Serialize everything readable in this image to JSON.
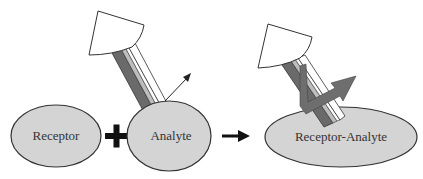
{
  "diagram": {
    "labels": {
      "receptor": "Receptor",
      "analyte": "Analyte",
      "complex": "Receptor-Analyte"
    },
    "operators": {
      "plus": "+",
      "yields": "→"
    },
    "colors": {
      "ellipse_fill": "#d4d4d4",
      "ellipse_stroke": "#333333",
      "stick_dark": "#6a6a6a",
      "stick_light": "#bdbdbd",
      "cup_fill": "#ffffff",
      "arrow_dark": "#222222",
      "arrow_gray": "#6e6e6e"
    }
  }
}
